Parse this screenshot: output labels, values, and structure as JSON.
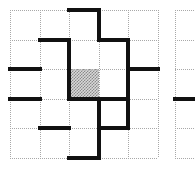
{
  "figure": {
    "kind": "maze-grid-diagram",
    "background_color": "#ffffff",
    "gridline_color": "#a8a8a8",
    "wall_color": "#111111",
    "shaded_cell_color": "#d8d8d8"
  },
  "grids": [
    {
      "name": "main-maze",
      "columns": 5,
      "rows": 5,
      "origin_x": 10,
      "origin_y": 10,
      "cell_size": 29.6,
      "wall_thickness": 4,
      "shaded_cells": [
        {
          "col": 3,
          "row": 3
        }
      ],
      "horizontal_walls": [
        {
          "row_boundary": 0,
          "col": 3
        },
        {
          "row_boundary": 1,
          "col": 2
        },
        {
          "row_boundary": 1,
          "col": 4
        },
        {
          "row_boundary": 2,
          "col": 1
        },
        {
          "row_boundary": 2,
          "col": 5
        },
        {
          "row_boundary": 3,
          "col": 1
        },
        {
          "row_boundary": 3,
          "col": 3
        },
        {
          "row_boundary": 3,
          "col": 4
        },
        {
          "row_boundary": 4,
          "col": 2
        },
        {
          "row_boundary": 4,
          "col": 4
        },
        {
          "row_boundary": 5,
          "col": 3
        }
      ],
      "vertical_walls": [
        {
          "col_boundary": 2,
          "row": 2
        },
        {
          "col_boundary": 2,
          "row": 3
        },
        {
          "col_boundary": 3,
          "row": 1
        },
        {
          "col_boundary": 3,
          "row": 4
        },
        {
          "col_boundary": 3,
          "row": 5
        },
        {
          "col_boundary": 4,
          "row": 2
        },
        {
          "col_boundary": 4,
          "row": 3
        },
        {
          "col_boundary": 4,
          "row": 4
        }
      ]
    },
    {
      "name": "secondary-maze-cropped",
      "columns": 1,
      "rows": 5,
      "origin_x": 175,
      "origin_y": 10,
      "cell_size": 29.6,
      "wall_thickness": 4,
      "shaded_cells": [],
      "horizontal_walls": [
        {
          "row_boundary": 3,
          "col": 1
        }
      ],
      "vertical_walls": []
    }
  ]
}
